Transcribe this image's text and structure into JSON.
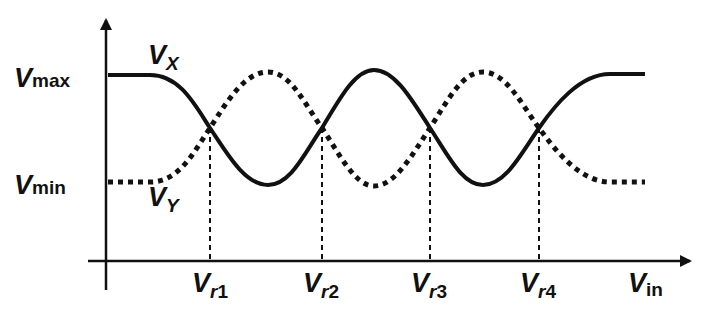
{
  "figure": {
    "type": "transfer-characteristic",
    "axes": {
      "x_label": {
        "main": "V",
        "sub": "in"
      },
      "y_levels": [
        {
          "name": "max",
          "main": "V",
          "sub": "max"
        },
        {
          "name": "min",
          "main": "V",
          "sub": "min"
        }
      ]
    },
    "curves": [
      {
        "name": "Vx",
        "label_main": "V",
        "label_sub": "X",
        "style": "solid",
        "start_level": "max",
        "end_level": "max"
      },
      {
        "name": "Vy",
        "label_main": "V",
        "label_sub": "Y",
        "style": "dotted",
        "start_level": "min",
        "end_level": "min"
      }
    ],
    "crossings": [
      {
        "main": "V",
        "sub_r": "r",
        "sub_n": "1"
      },
      {
        "main": "V",
        "sub_r": "r",
        "sub_n": "2"
      },
      {
        "main": "V",
        "sub_r": "r",
        "sub_n": "3"
      },
      {
        "main": "V",
        "sub_r": "r",
        "sub_n": "4"
      }
    ],
    "colors": {
      "ink": "#111111",
      "background": "#ffffff"
    }
  }
}
